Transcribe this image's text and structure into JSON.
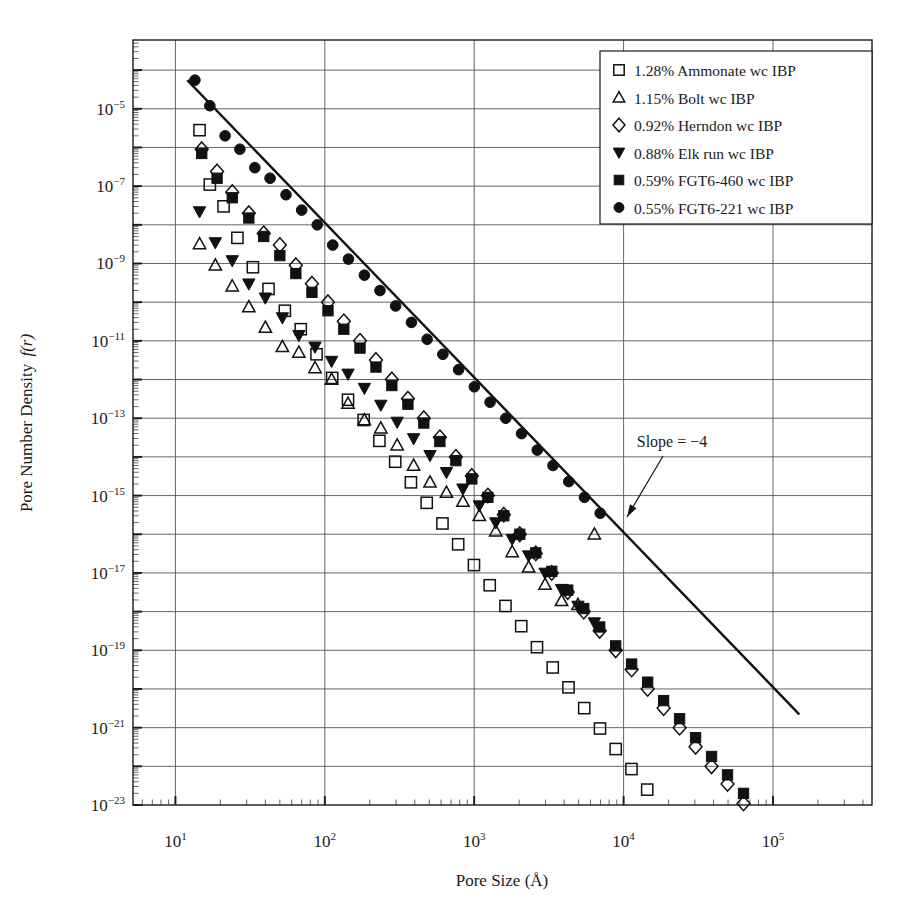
{
  "chart_data": {
    "type": "scatter",
    "title": "",
    "xlabel": "Pore Size (Å)",
    "ylabel": "Pore Number Density f(r)",
    "xscale": "log",
    "yscale": "log",
    "xlim": [
      5.2,
      460000
    ],
    "ylim": [
      1e-23,
      0.0006
    ],
    "xticks": [
      10,
      100,
      1000,
      10000,
      100000
    ],
    "xtick_labels": [
      "10^1",
      "10^2",
      "10^3",
      "10^4",
      "10^5"
    ],
    "yticks": [
      1e-05,
      1e-07,
      1e-09,
      1e-11,
      1e-13,
      1e-15,
      1e-17,
      1e-19,
      1e-21,
      1e-23
    ],
    "ytick_labels": [
      "10^-5",
      "10^-7",
      "10^-9",
      "10^-11",
      "10^-13",
      "10^-15",
      "10^-17",
      "10^-19",
      "10^-21",
      "10^-23"
    ],
    "grid": true,
    "grid_axis": "both",
    "legend_position": "top-right",
    "annotations": [
      {
        "text": "Slope = −4",
        "x_px": 672,
        "y_px": 447,
        "arrow_from_px": [
          663,
          456
        ],
        "arrow_to_px": [
          627,
          517
        ]
      }
    ],
    "reference_line": {
      "label": "Slope = −4",
      "slope": -4,
      "x_start": 12.0,
      "y_start": 5.5e-05,
      "x_end": 150000.0,
      "y_end": 2.2e-21
    },
    "series": [
      {
        "name": "1.28% Ammonate wc IBP",
        "marker": "open-square",
        "points": [
          [
            14.5,
            2.8e-06
          ],
          [
            17.0,
            1.1e-07
          ],
          [
            21.0,
            3e-08
          ],
          [
            26.0,
            4.6e-09
          ],
          [
            33.0,
            8e-10
          ],
          [
            42.0,
            2.2e-10
          ],
          [
            54.0,
            6e-11
          ],
          [
            69.0,
            2e-11
          ],
          [
            88.0,
            4.5e-12
          ],
          [
            112.0,
            1.1e-12
          ],
          [
            143.0,
            3e-13
          ],
          [
            182.0,
            9e-14
          ],
          [
            232.0,
            2.6e-14
          ],
          [
            296.0,
            7.5e-15
          ],
          [
            377.0,
            2.2e-15
          ],
          [
            481.0,
            6.5e-16
          ],
          [
            613.0,
            1.9e-16
          ],
          [
            781.0,
            5.5e-17
          ],
          [
            996.0,
            1.6e-17
          ],
          [
            1270.0,
            4.8e-18
          ],
          [
            1619.0,
            1.4e-18
          ],
          [
            2064.0,
            4.2e-19
          ],
          [
            2631.0,
            1.2e-19
          ],
          [
            3354.0,
            3.6e-20
          ],
          [
            4276.0,
            1.1e-20
          ],
          [
            5450.0,
            3.2e-21
          ],
          [
            6948.0,
            9.5e-22
          ],
          [
            8857.0,
            2.8e-22
          ],
          [
            11290.0,
            8.5e-23
          ],
          [
            14390.0,
            2.5e-23
          ],
          [
            18350.0,
            7.5e-24
          ],
          [
            23390.0,
            2.2e-24
          ],
          [
            29820.0,
            6.6e-25
          ],
          [
            38020.0,
            2e-25
          ],
          [
            48470.0,
            6e-26
          ],
          [
            61790.0,
            1.8e-26
          ],
          [
            78770.0,
            5.4e-27
          ],
          [
            100400.0,
            1.6e-27
          ],
          [
            128000.0,
            5e-28
          ]
        ]
      },
      {
        "name": "1.15% Bolt wc IBP",
        "marker": "open-triangle-up",
        "points": [
          [
            14.5,
            3.2e-09
          ],
          [
            18.5,
            9e-10
          ],
          [
            24.0,
            2.6e-10
          ],
          [
            31.0,
            7.5e-11
          ],
          [
            40.0,
            2.2e-11
          ],
          [
            52.0,
            7e-12
          ],
          [
            67.0,
            5e-12
          ],
          [
            86.0,
            2e-12
          ],
          [
            111.0,
            1e-12
          ],
          [
            143.0,
            2.4e-13
          ],
          [
            184.0,
            9e-14
          ],
          [
            237.0,
            5.5e-14
          ],
          [
            305.0,
            2e-14
          ],
          [
            393.0,
            6e-15
          ],
          [
            506.0,
            2.2e-15
          ],
          [
            652.0,
            1.2e-15
          ],
          [
            840.0,
            7e-16
          ],
          [
            1082.0,
            3e-16
          ],
          [
            1394.0,
            1.2e-16
          ],
          [
            1796.0,
            3.5e-17
          ],
          [
            2314.0,
            1.4e-17
          ],
          [
            2981.0,
            5e-18
          ],
          [
            3841.0,
            1.9e-18
          ],
          [
            4948.0,
            1.5e-18
          ],
          [
            6374.0,
            1e-16
          ]
        ]
      },
      {
        "name": "0.92% Herndon wc IBP",
        "marker": "open-diamond",
        "points": [
          [
            15.0,
            9e-07
          ],
          [
            19.0,
            2.4e-07
          ],
          [
            24.0,
            7e-08
          ],
          [
            31.0,
            2e-08
          ],
          [
            39.0,
            6e-09
          ],
          [
            50.0,
            3e-09
          ],
          [
            64.0,
            9e-10
          ],
          [
            82.0,
            3e-10
          ],
          [
            105.0,
            1e-10
          ],
          [
            134.0,
            3.2e-11
          ],
          [
            172.0,
            1e-11
          ],
          [
            220.0,
            3.2e-12
          ],
          [
            281.0,
            1e-12
          ],
          [
            360.0,
            3.2e-13
          ],
          [
            460.0,
            1e-13
          ],
          [
            589.0,
            3.2e-14
          ],
          [
            754.0,
            1e-14
          ],
          [
            964.0,
            3.2e-15
          ],
          [
            1234.0,
            1e-15
          ],
          [
            1578.0,
            3.2e-16
          ],
          [
            2019.0,
            1e-16
          ],
          [
            2583.0,
            3.2e-17
          ],
          [
            3305.0,
            1e-17
          ],
          [
            4228.0,
            3.2e-18
          ],
          [
            5409.0,
            1e-18
          ],
          [
            6920.0,
            3.2e-19
          ],
          [
            8853.0,
            1e-19
          ],
          [
            11320.0,
            3.2e-20
          ],
          [
            14490.0,
            1e-20
          ],
          [
            18530.0,
            3.2e-21
          ],
          [
            23710.0,
            1e-21
          ],
          [
            30330.0,
            3.2e-22
          ],
          [
            38800.0,
            1e-22
          ],
          [
            49630.0,
            3.5e-23
          ],
          [
            63500.0,
            1.1e-23
          ],
          [
            81240.0,
            4e-24
          ],
          [
            103900.0,
            1.2e-24
          ]
        ]
      },
      {
        "name": "0.88% Elk run wc IBP",
        "marker": "filled-triangle-down",
        "points": [
          [
            14.5,
            2.2e-08
          ],
          [
            18.5,
            3.5e-09
          ],
          [
            24.0,
            1.2e-09
          ],
          [
            31.0,
            3e-10
          ],
          [
            40.0,
            1.3e-10
          ],
          [
            52.0,
            4e-11
          ],
          [
            67.0,
            1.4e-11
          ],
          [
            86.0,
            7e-12
          ],
          [
            111.0,
            3e-12
          ],
          [
            143.0,
            1.4e-12
          ],
          [
            184.0,
            6e-13
          ],
          [
            237.0,
            2.2e-13
          ],
          [
            305.0,
            8e-14
          ],
          [
            393.0,
            3e-14
          ],
          [
            506.0,
            1.1e-14
          ],
          [
            652.0,
            4e-15
          ],
          [
            840.0,
            1.5e-15
          ],
          [
            1082.0,
            5.5e-16
          ],
          [
            1394.0,
            2e-16
          ],
          [
            1796.0,
            7.5e-17
          ],
          [
            2314.0,
            2.8e-17
          ],
          [
            2981.0,
            1e-17
          ],
          [
            3841.0,
            3.8e-18
          ],
          [
            4948.0,
            1.4e-18
          ],
          [
            6374.0,
            5.2e-19
          ]
        ]
      },
      {
        "name": "0.59% FGT6-460 wc IBP",
        "marker": "filled-square",
        "points": [
          [
            15.0,
            7e-07
          ],
          [
            19.0,
            1.6e-07
          ],
          [
            24.0,
            5e-08
          ],
          [
            31.0,
            1.5e-08
          ],
          [
            39.0,
            5e-09
          ],
          [
            50.0,
            1.6e-09
          ],
          [
            64.0,
            5.5e-10
          ],
          [
            82.0,
            1.8e-10
          ],
          [
            105.0,
            6e-11
          ],
          [
            134.0,
            2e-11
          ],
          [
            172.0,
            6.5e-12
          ],
          [
            220.0,
            2.1e-12
          ],
          [
            281.0,
            7e-13
          ],
          [
            360.0,
            2.3e-13
          ],
          [
            460.0,
            7.5e-14
          ],
          [
            589.0,
            2.5e-14
          ],
          [
            754.0,
            8e-15
          ],
          [
            964.0,
            2.7e-15
          ],
          [
            1234.0,
            9e-16
          ],
          [
            1578.0,
            3e-16
          ],
          [
            2019.0,
            1e-16
          ],
          [
            2583.0,
            3.3e-17
          ],
          [
            3305.0,
            1.1e-17
          ],
          [
            4228.0,
            3.6e-18
          ],
          [
            5409.0,
            1.2e-18
          ],
          [
            6920.0,
            4e-19
          ],
          [
            8853.0,
            1.3e-19
          ],
          [
            11320.0,
            4.4e-20
          ],
          [
            14490.0,
            1.5e-20
          ],
          [
            18530.0,
            5e-21
          ],
          [
            23710.0,
            1.7e-21
          ],
          [
            30330.0,
            5.5e-22
          ],
          [
            38800.0,
            1.8e-22
          ],
          [
            49630.0,
            6e-23
          ],
          [
            63500.0,
            2e-23
          ],
          [
            81240.0,
            7e-24
          ],
          [
            103900.0,
            2.3e-24
          ],
          [
            133000.0,
            8e-25
          ]
        ]
      },
      {
        "name": "0.55% FGT6-221 wc IBP",
        "marker": "filled-circle",
        "points": [
          [
            13.5,
            5.5e-05
          ],
          [
            17.0,
            1.2e-05
          ],
          [
            21.5,
            2e-06
          ],
          [
            27.0,
            9e-07
          ],
          [
            34.0,
            3e-07
          ],
          [
            43.0,
            1.6e-07
          ],
          [
            55.0,
            6e-08
          ],
          [
            70.0,
            2.4e-08
          ],
          [
            89.0,
            1e-08
          ],
          [
            113.0,
            3e-09
          ],
          [
            144.0,
            1.3e-09
          ],
          [
            184.0,
            5e-10
          ],
          [
            234.0,
            2e-10
          ],
          [
            298.0,
            8e-11
          ],
          [
            380.0,
            3e-11
          ],
          [
            484.0,
            1.1e-11
          ],
          [
            617.0,
            4.5e-12
          ],
          [
            786.0,
            1.8e-12
          ],
          [
            1002.0,
            6.5e-13
          ],
          [
            1277.0,
            2.6e-13
          ],
          [
            1627.0,
            1e-13
          ],
          [
            2074.0,
            4e-14
          ],
          [
            2643.0,
            1.5e-14
          ],
          [
            3368.0,
            6e-15
          ],
          [
            4293.0,
            2.3e-15
          ],
          [
            5471.0,
            9e-16
          ],
          [
            6972.0,
            3.5e-16
          ]
        ]
      }
    ]
  },
  "legend": {
    "items": [
      {
        "marker": "open-square",
        "label": "1.28% Ammonate wc IBP"
      },
      {
        "marker": "open-triangle-up",
        "label": "1.15% Bolt wc IBP"
      },
      {
        "marker": "open-diamond",
        "label": "0.92% Herndon wc IBP"
      },
      {
        "marker": "filled-triangle-down",
        "label": "0.88% Elk run wc IBP"
      },
      {
        "marker": "filled-square",
        "label": "0.59% FGT6-460 wc IBP"
      },
      {
        "marker": "filled-circle",
        "label": "0.55% FGT6-221 wc IBP"
      }
    ]
  },
  "axes": {
    "x_title": "Pore Size (Å)",
    "y_title_main": "Pore Number Density",
    "y_title_italic": "f(r)",
    "x_tick_mantissa": [
      "10",
      "10",
      "10",
      "10",
      "10"
    ],
    "x_tick_exponents": [
      "1",
      "2",
      "3",
      "4",
      "5"
    ],
    "y_tick_mantissa": [
      "10",
      "10",
      "10",
      "10",
      "10",
      "10",
      "10",
      "10",
      "10",
      "10"
    ],
    "y_tick_exponents": [
      "−5",
      "−7",
      "−9",
      "−11",
      "−13",
      "−15",
      "−17",
      "−19",
      "−21",
      "−23"
    ]
  },
  "annotation": {
    "slope_label": "Slope = −4"
  },
  "colors": {
    "ink": "#1a1a1a",
    "grid": "#555555",
    "background": "#ffffff"
  }
}
